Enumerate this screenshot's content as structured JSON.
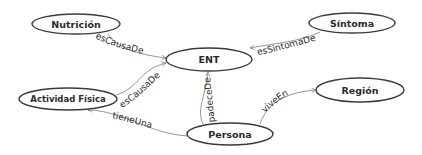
{
  "diagram": {
    "type": "ontology-graph",
    "colors": {
      "node_stroke": "#3a3a3a",
      "edge_stroke": "#8a8a8a",
      "text": "#2b2b2b",
      "background": "#ffffff"
    },
    "nodes": {
      "nutricion": {
        "label": "Nutrición"
      },
      "sintoma": {
        "label": "Síntoma"
      },
      "ent": {
        "label": "ENT"
      },
      "actividad_fisica": {
        "label": "Actividad Física"
      },
      "persona": {
        "label": "Persona"
      },
      "region": {
        "label": "Región"
      }
    },
    "edges": {
      "nutricion_ent": {
        "label": "esCausaDe",
        "from": "Nutrición",
        "to": "ENT"
      },
      "sintoma_ent": {
        "label": "esSintomaDe",
        "from": "Síntoma",
        "to": "ENT"
      },
      "actividad_ent": {
        "label": "esCausaDe",
        "from": "Actividad Física",
        "to": "ENT"
      },
      "persona_ent": {
        "label": "padeceDe",
        "from": "Persona",
        "to": "ENT"
      },
      "persona_actividad": {
        "label": "tieneUna",
        "from": "Persona",
        "to": "Actividad Física"
      },
      "persona_region": {
        "label": "viveEn",
        "from": "Persona",
        "to": "Región"
      }
    }
  }
}
